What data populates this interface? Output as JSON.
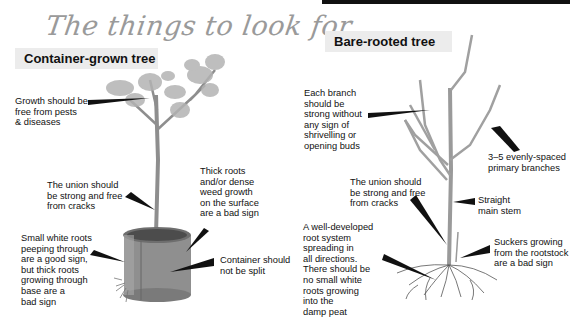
{
  "title": "The things to look for",
  "sections": {
    "container": {
      "label": "Container-grown tree",
      "callouts": [
        {
          "id": "growth",
          "text": "Growth should be\nfree from pests\n& diseases"
        },
        {
          "id": "union",
          "text": "The union should\nbe strong and free\nfrom cracks"
        },
        {
          "id": "roots",
          "text": "Small white roots\npeeping through\nare a good sign,\nbut thick roots\ngrowing through\nbase are a\nbad sign"
        },
        {
          "id": "weeds",
          "text": "Thick roots\nand/or dense\nweed growth\non the surface\nare a bad sign"
        },
        {
          "id": "split",
          "text": "Container should\nnot be split"
        }
      ]
    },
    "bare": {
      "label": "Bare-rooted tree",
      "callouts": [
        {
          "id": "branch",
          "text": "Each branch\nshould be\nstrong without\nany sign of\nshrivelling or\nopening buds"
        },
        {
          "id": "primary",
          "text": "3–5 evenly-spaced\nprimary branches"
        },
        {
          "id": "union",
          "text": "The union should\nbe strong and free\nfrom cracks"
        },
        {
          "id": "stem",
          "text": "Straight\nmain stem"
        },
        {
          "id": "rootsys",
          "text": "A well-developed\nroot system\nspreading in\nall directions.\nThere should be\nno small white\nroots growing\ninto the\ndamp peat"
        },
        {
          "id": "suckers",
          "text": "Suckers growing\nfrom the rootstock\nare a bad sign"
        }
      ]
    }
  },
  "colors": {
    "title": "#9a9a9a",
    "label_bg": "#ececec",
    "pointer": "#111111",
    "bark": "#9c9c9c",
    "foliage": "#a8a8a8",
    "pot": "#8a8a8a"
  }
}
